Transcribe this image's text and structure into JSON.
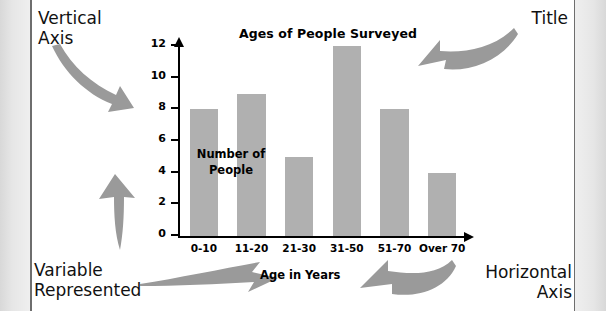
{
  "annotations": {
    "vertical_axis": "Vertical\nAxis",
    "title": "Title",
    "variable_represented": "Variable\nRepresented",
    "horizontal_axis": "Horizontal\nAxis"
  },
  "axis_titles": {
    "y": "Number\nof\nPeople",
    "x": "Age in Years"
  },
  "colors": {
    "bar_fill": "#b0b0b0",
    "arrow_fill": "#9a9a9a",
    "axis": "#000000",
    "text": "#111111",
    "page_edge": "#e2e2e2"
  },
  "chart_data": {
    "type": "bar",
    "title": "Ages of People Surveyed",
    "categories": [
      "0-10",
      "11-20",
      "21-30",
      "31-50",
      "51-70",
      "Over 70"
    ],
    "values": [
      8,
      9,
      5,
      12,
      8,
      4
    ],
    "xlabel": "Age in Years",
    "ylabel": "Number of People",
    "ylim": [
      0,
      12
    ],
    "ytick_labels": [
      "0",
      "2",
      "4",
      "6",
      "8",
      "10",
      "12"
    ],
    "ytick_values": [
      0,
      2,
      4,
      6,
      8,
      10,
      12
    ],
    "grid": false,
    "legend": false
  }
}
